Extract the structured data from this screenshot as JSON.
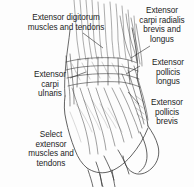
{
  "figure": {
    "title": "Select extensor muscles and tendons",
    "style": "grayscale pen-and-ink anatomical line drawing",
    "background_color": "#fdfdfd",
    "ink_color": "#1c1c1c",
    "line_color": "#3a3a3a"
  },
  "labels": {
    "extensor_digitorum": {
      "text": "Extensor digitorum\nmuscles and tendons",
      "align": "center"
    },
    "extensor_carpi_radialis": {
      "text": "Extensor\ncarpi radialis\nbrevis and\nlongus",
      "align": "center"
    },
    "extensor_carpi_ulnaris": {
      "text": "Extensor\ncarpi\nulnaris",
      "align": "center"
    },
    "extensor_pollicis_longus": {
      "text": "Extensor\npollicis\nlongus",
      "align": "center"
    },
    "extensor_pollicis_brevis": {
      "text": "Extensor\npollicis\nbrevis",
      "align": "center"
    },
    "caption": {
      "text": "Select\nextensor\nmuscles and\ntendons",
      "align": "center"
    }
  }
}
